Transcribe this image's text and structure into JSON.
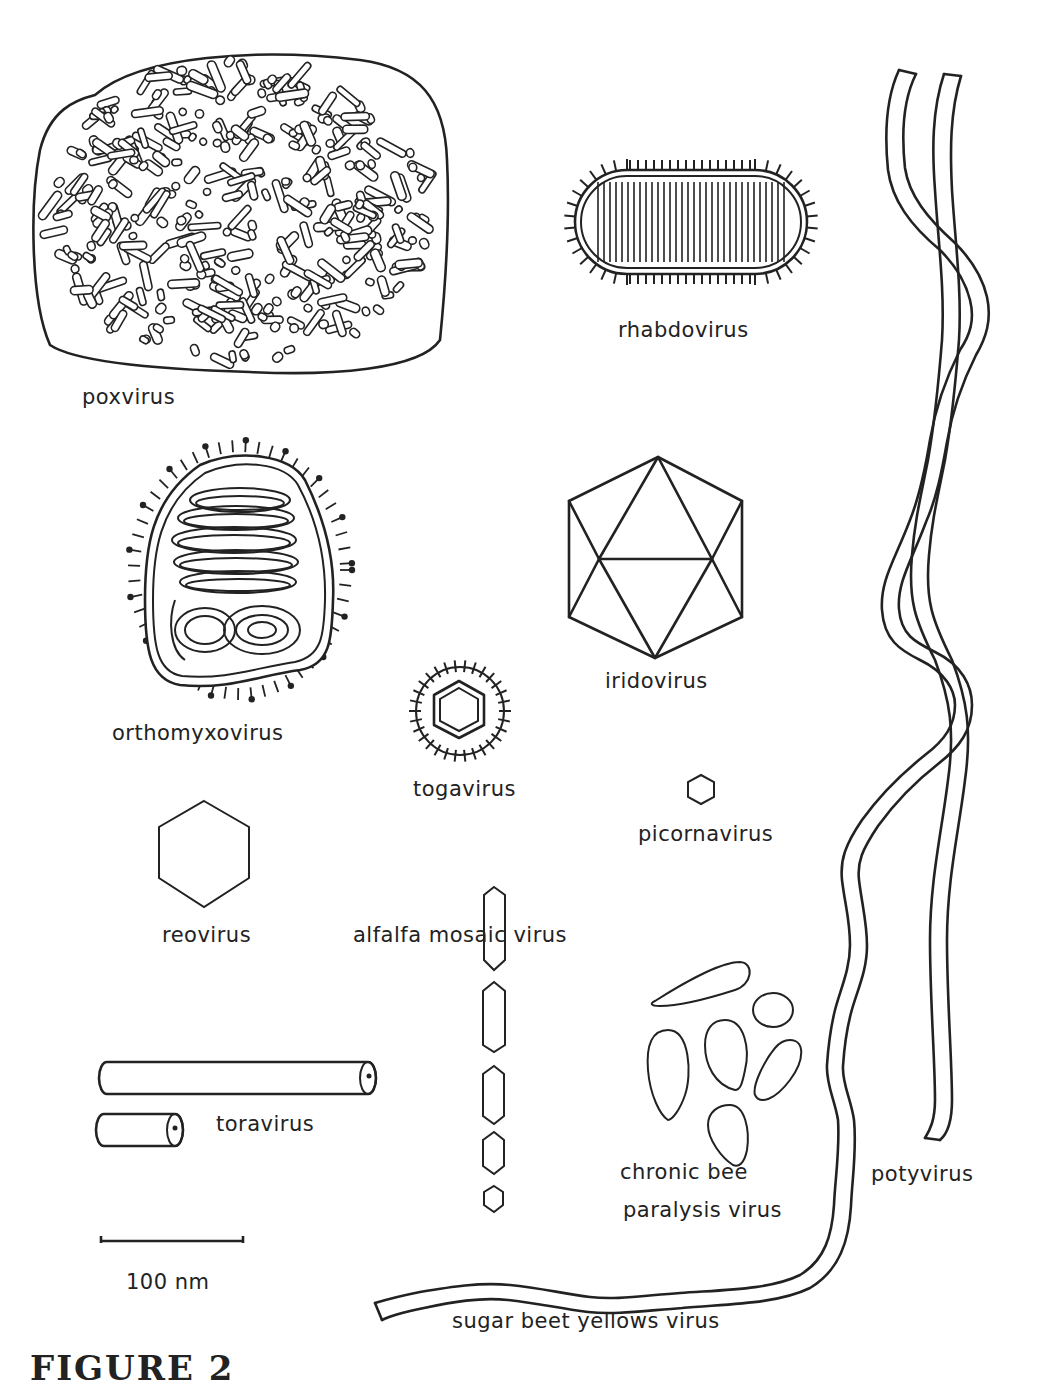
{
  "figure": {
    "caption": "FIGURE 2",
    "scale_bar": {
      "label": "100 nm",
      "length_px": 145
    },
    "viruses": [
      {
        "id": "poxvirus",
        "label": "poxvirus",
        "shape": "large ovoid with surface tubules"
      },
      {
        "id": "rhabdovirus",
        "label": "rhabdovirus",
        "shape": "bullet/bacilliform with spikes and striations"
      },
      {
        "id": "orthomyxovirus",
        "label": "orthomyxovirus",
        "shape": "pleomorphic enveloped with coiled nucleocapsid and knobbed spikes"
      },
      {
        "id": "iridovirus",
        "label": "iridovirus",
        "shape": "icosahedron"
      },
      {
        "id": "togavirus",
        "label": "togavirus",
        "shape": "spherical enveloped with hexagonal core"
      },
      {
        "id": "picornavirus",
        "label": "picornavirus",
        "shape": "small hexagon"
      },
      {
        "id": "reovirus",
        "label": "reovirus",
        "shape": "hexagon"
      },
      {
        "id": "alfalfa-mosaic-virus",
        "label": "alfalfa mosaic virus",
        "shape": "series of bacilliform particles of decreasing length"
      },
      {
        "id": "toravirus",
        "label": "toravirus",
        "shape": "two rigid rods (long and short)"
      },
      {
        "id": "chronic-bee-paralysis-virus",
        "label_line1": "chronic bee",
        "label_line2": "paralysis virus",
        "shape": "irregular ellipsoidal particles"
      },
      {
        "id": "potyvirus",
        "label": "potyvirus",
        "shape": "long flexuous filament"
      },
      {
        "id": "sugar-beet-yellows-virus",
        "label": "sugar beet yellows virus",
        "shape": "very long flexuous filament"
      }
    ]
  }
}
